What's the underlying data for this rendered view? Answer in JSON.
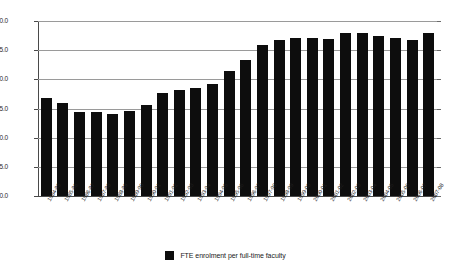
{
  "chart_data": {
    "type": "bar",
    "title": "",
    "xlabel": "",
    "ylabel": "",
    "ylim": [
      0.0,
      30.0
    ],
    "ytick_step": 5.0,
    "grid": true,
    "legend_position": "bottom-center",
    "bar_color": "#0d0d0d",
    "categories": [
      "1984-85",
      "1985-86",
      "1986-87",
      "1987-88",
      "1988-89",
      "1989-90",
      "1990-91",
      "1991-92",
      "1992-93",
      "1993-94",
      "1994-95",
      "1995-96",
      "1996-97",
      "1997-98",
      "1998-99",
      "1999-00",
      "2000-01",
      "2001-02",
      "2002-03",
      "2003-04",
      "2004-05",
      "2005-06",
      "2006-07",
      "2007-08"
    ],
    "ytick_labels": [
      "0.0",
      "5.0",
      "10.0",
      "15.0",
      "20.0",
      "25.0",
      "30.0"
    ],
    "ytick_values": [
      0.0,
      5.0,
      10.0,
      15.0,
      20.0,
      25.0,
      30.0
    ],
    "series": [
      {
        "name": "FTE enrolment per full-time faculty",
        "values": [
          16.8,
          15.9,
          14.4,
          14.4,
          14.1,
          14.6,
          15.6,
          17.6,
          18.2,
          18.5,
          19.2,
          21.4,
          23.3,
          25.9,
          26.8,
          27.1,
          27.1,
          27.0,
          28.0,
          28.0,
          27.5,
          27.1,
          26.8,
          27.9
        ]
      }
    ],
    "legend": [
      {
        "label": "FTE enrolment per full-time faculty",
        "color": "#0d0d0d"
      }
    ]
  }
}
